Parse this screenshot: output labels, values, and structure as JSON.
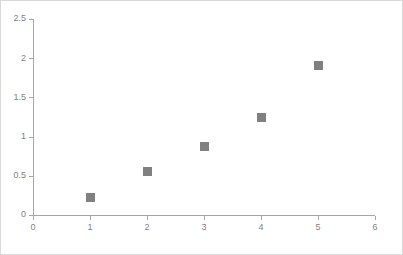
{
  "chart_data": {
    "type": "scatter",
    "title": "",
    "subtitle": "",
    "xlabel": "",
    "ylabel": "",
    "x": [
      1,
      2,
      3,
      4,
      5
    ],
    "values": [
      0.22,
      0.55,
      0.88,
      1.25,
      1.91
    ],
    "series": [
      {
        "name": "Series1",
        "marker": "square",
        "color": "#808080",
        "points": [
          {
            "x": 1,
            "y": 0.22
          },
          {
            "x": 2,
            "y": 0.55
          },
          {
            "x": 3,
            "y": 0.88
          },
          {
            "x": 4,
            "y": 1.25
          },
          {
            "x": 5,
            "y": 1.91
          }
        ]
      }
    ],
    "xlim": [
      0,
      6
    ],
    "ylim": [
      0,
      2.5
    ],
    "xticks": [
      0,
      1,
      2,
      3,
      4,
      5,
      6
    ],
    "yticks": [
      0,
      0.5,
      1,
      1.5,
      2,
      2.5
    ],
    "xtick_labels": [
      "0",
      "1",
      "2",
      "3",
      "4",
      "5",
      "6"
    ],
    "ytick_labels": [
      "0",
      "0.5",
      "1",
      "1.5",
      "2",
      "2.5"
    ],
    "grid": false,
    "legend": false,
    "legend_position": "none",
    "annotations": []
  },
  "style": {
    "axis_color": "#a6a6a6",
    "tick_label_color": "#7f7f7f",
    "marker_color": "#808080",
    "plot_background": "#ffffff",
    "frame_border_color": "#d9d9d9"
  },
  "geometry": {
    "plot_left": 32,
    "plot_right": 374,
    "plot_top": 18,
    "plot_bottom": 214,
    "marker_size": 9,
    "tick_length": 4
  }
}
